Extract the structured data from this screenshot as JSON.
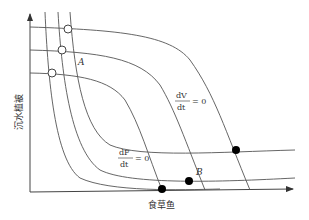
{
  "diagram": {
    "x_axis_label": "食草鱼",
    "y_axis_label": "沉水植被",
    "point_a": "A",
    "point_b": "B",
    "isocline_v": {
      "num": "dV",
      "den": "dt",
      "rhs": "= 0"
    },
    "isocline_f": {
      "num": "dF",
      "den": "dt",
      "rhs": "= 0"
    },
    "colors": {
      "curve": "#555555",
      "axis": "#444444",
      "filled_point": "#000000",
      "open_point": "#ffffff"
    }
  }
}
